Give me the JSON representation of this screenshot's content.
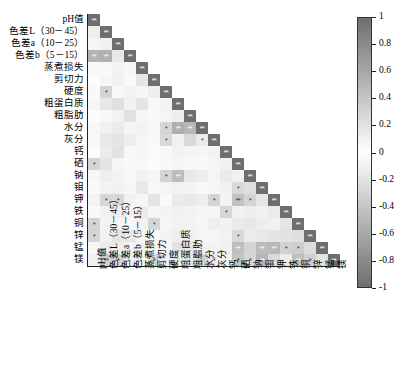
{
  "chart_data": {
    "type": "heatmap",
    "title": "",
    "xlabel": "",
    "ylabel": "",
    "grid": false,
    "triangle": "lower",
    "legend_position": "right",
    "colorbar": {
      "min": -1,
      "max": 1,
      "ticks": [
        "1",
        "0.8",
        "0.6",
        "0.4",
        "0.2",
        "0",
        "-0.2",
        "-0.4",
        "-0.6",
        "-0.8",
        "-1"
      ],
      "tick_values": [
        1,
        0.8,
        0.6,
        0.4,
        0.2,
        0,
        -0.2,
        -0.4,
        -0.6,
        -0.8,
        -1
      ],
      "colormap": "grey-diverging",
      "color_high": "#6e6e6e",
      "color_mid": "#ffffff",
      "color_low": "#6e6e6e"
    },
    "significance_legend": {
      "one_star": "*",
      "two_star": "**"
    },
    "categories": [
      "pH值",
      "色差L（30－45）",
      "色差a（10－25）",
      "色差b（5－15）",
      "蒸煮损失",
      "剪切力",
      "硬度",
      "粗蛋白质",
      "粗脂肪",
      "水分",
      "灰分",
      "钙",
      "硒",
      "钠",
      "钼",
      "钾",
      "铁",
      "铜",
      "锌",
      "锰",
      "镁"
    ],
    "matrix": [
      [
        1.0
      ],
      [
        0.12,
        1.0
      ],
      [
        -0.06,
        0.1,
        1.0
      ],
      [
        0.52,
        0.54,
        0.16,
        1.0
      ],
      [
        0.05,
        -0.04,
        0.08,
        0.06,
        1.0
      ],
      [
        0.02,
        0.06,
        0.1,
        0.04,
        0.18,
        1.0
      ],
      [
        0.04,
        0.3,
        0.05,
        0.08,
        0.06,
        0.12,
        1.0
      ],
      [
        0.06,
        0.16,
        0.22,
        0.1,
        0.18,
        0.05,
        0.08,
        1.0
      ],
      [
        0.03,
        0.05,
        0.09,
        0.2,
        0.06,
        0.04,
        0.07,
        0.12,
        1.0
      ],
      [
        0.05,
        0.1,
        0.14,
        0.06,
        0.08,
        0.05,
        0.28,
        0.55,
        0.5,
        1.0
      ],
      [
        0.04,
        0.16,
        0.18,
        0.12,
        0.07,
        0.04,
        0.27,
        0.1,
        0.26,
        0.14,
        1.0
      ],
      [
        0.02,
        0.14,
        0.2,
        0.05,
        0.06,
        0.03,
        0.05,
        0.09,
        0.07,
        0.06,
        0.08,
        1.0
      ],
      [
        0.29,
        0.18,
        0.06,
        0.04,
        0.05,
        0.03,
        0.04,
        0.06,
        0.05,
        0.04,
        0.06,
        0.1,
        1.0
      ],
      [
        0.06,
        0.12,
        0.08,
        0.05,
        0.1,
        0.06,
        0.3,
        0.46,
        0.16,
        0.12,
        0.07,
        0.14,
        0.1,
        1.0
      ],
      [
        0.04,
        0.08,
        0.1,
        0.06,
        0.16,
        0.05,
        0.07,
        0.09,
        0.08,
        0.05,
        0.06,
        0.1,
        0.26,
        0.22,
        1.0
      ],
      [
        0.08,
        0.28,
        0.27,
        0.1,
        0.06,
        0.18,
        0.05,
        0.14,
        0.16,
        0.12,
        0.29,
        0.08,
        0.42,
        0.3,
        0.18,
        1.0
      ],
      [
        0.05,
        0.1,
        0.12,
        0.07,
        0.14,
        0.06,
        0.08,
        0.1,
        0.09,
        0.06,
        0.07,
        0.28,
        0.1,
        0.12,
        0.1,
        0.14,
        1.0
      ],
      [
        0.3,
        0.08,
        0.06,
        0.05,
        0.1,
        0.28,
        0.07,
        0.09,
        0.08,
        0.06,
        0.12,
        0.1,
        0.14,
        0.16,
        0.12,
        0.1,
        0.18,
        1.0
      ],
      [
        0.29,
        0.1,
        0.18,
        0.16,
        0.06,
        0.05,
        0.08,
        0.12,
        0.1,
        0.07,
        0.06,
        0.09,
        0.27,
        0.14,
        0.16,
        0.18,
        0.2,
        0.22,
        1.0
      ],
      [
        0.06,
        0.14,
        0.12,
        0.08,
        0.1,
        0.06,
        0.07,
        0.2,
        0.18,
        0.09,
        0.08,
        0.1,
        0.44,
        0.3,
        0.46,
        0.48,
        0.32,
        0.34,
        0.24,
        1.0
      ],
      [
        0.1,
        0.33,
        0.31,
        0.12,
        0.08,
        0.29,
        0.1,
        0.14,
        0.16,
        0.31,
        0.12,
        0.09,
        0.4,
        0.28,
        0.52,
        0.26,
        0.14,
        0.45,
        0.33,
        0.2,
        1.0
      ]
    ],
    "significance": [
      {
        "row": 0,
        "col": 0,
        "mark": "**"
      },
      {
        "row": 1,
        "col": 1,
        "mark": "**"
      },
      {
        "row": 2,
        "col": 2,
        "mark": "**"
      },
      {
        "row": 3,
        "col": 0,
        "mark": "**"
      },
      {
        "row": 3,
        "col": 1,
        "mark": "**"
      },
      {
        "row": 3,
        "col": 3,
        "mark": "**"
      },
      {
        "row": 4,
        "col": 4,
        "mark": "**"
      },
      {
        "row": 5,
        "col": 5,
        "mark": "**"
      },
      {
        "row": 6,
        "col": 1,
        "mark": "*"
      },
      {
        "row": 6,
        "col": 6,
        "mark": "**"
      },
      {
        "row": 7,
        "col": 7,
        "mark": "**"
      },
      {
        "row": 8,
        "col": 8,
        "mark": "**"
      },
      {
        "row": 9,
        "col": 6,
        "mark": "*"
      },
      {
        "row": 9,
        "col": 7,
        "mark": "**"
      },
      {
        "row": 9,
        "col": 8,
        "mark": "**"
      },
      {
        "row": 9,
        "col": 9,
        "mark": "**"
      },
      {
        "row": 10,
        "col": 6,
        "mark": "*"
      },
      {
        "row": 10,
        "col": 9,
        "mark": "*"
      },
      {
        "row": 10,
        "col": 10,
        "mark": "**"
      },
      {
        "row": 11,
        "col": 11,
        "mark": "**"
      },
      {
        "row": 12,
        "col": 0,
        "mark": "*"
      },
      {
        "row": 12,
        "col": 12,
        "mark": "**"
      },
      {
        "row": 13,
        "col": 6,
        "mark": "*"
      },
      {
        "row": 13,
        "col": 7,
        "mark": "**"
      },
      {
        "row": 13,
        "col": 13,
        "mark": "**"
      },
      {
        "row": 14,
        "col": 12,
        "mark": "*"
      },
      {
        "row": 14,
        "col": 14,
        "mark": "**"
      },
      {
        "row": 15,
        "col": 1,
        "mark": "*"
      },
      {
        "row": 15,
        "col": 2,
        "mark": "*"
      },
      {
        "row": 15,
        "col": 10,
        "mark": "*"
      },
      {
        "row": 15,
        "col": 12,
        "mark": "**"
      },
      {
        "row": 15,
        "col": 13,
        "mark": "*"
      },
      {
        "row": 15,
        "col": 15,
        "mark": "**"
      },
      {
        "row": 16,
        "col": 11,
        "mark": "*"
      },
      {
        "row": 16,
        "col": 16,
        "mark": "**"
      },
      {
        "row": 17,
        "col": 0,
        "mark": "*"
      },
      {
        "row": 17,
        "col": 5,
        "mark": "*"
      },
      {
        "row": 17,
        "col": 17,
        "mark": "**"
      },
      {
        "row": 18,
        "col": 0,
        "mark": "*"
      },
      {
        "row": 18,
        "col": 12,
        "mark": "*"
      },
      {
        "row": 18,
        "col": 18,
        "mark": "**"
      },
      {
        "row": 19,
        "col": 12,
        "mark": "**"
      },
      {
        "row": 19,
        "col": 14,
        "mark": "**"
      },
      {
        "row": 19,
        "col": 15,
        "mark": "**"
      },
      {
        "row": 19,
        "col": 16,
        "mark": "*"
      },
      {
        "row": 19,
        "col": 17,
        "mark": "*"
      },
      {
        "row": 19,
        "col": 19,
        "mark": "**"
      },
      {
        "row": 20,
        "col": 1,
        "mark": "**"
      },
      {
        "row": 20,
        "col": 2,
        "mark": "*"
      },
      {
        "row": 20,
        "col": 5,
        "mark": "*"
      },
      {
        "row": 20,
        "col": 10,
        "mark": "*"
      },
      {
        "row": 20,
        "col": 12,
        "mark": "*"
      },
      {
        "row": 20,
        "col": 13,
        "mark": "*"
      },
      {
        "row": 20,
        "col": 14,
        "mark": "**"
      },
      {
        "row": 20,
        "col": 17,
        "mark": "**"
      },
      {
        "row": 20,
        "col": 18,
        "mark": "*"
      },
      {
        "row": 20,
        "col": 20,
        "mark": "**"
      }
    ]
  },
  "layout": {
    "grid_left": 88,
    "grid_top": 14,
    "cell": 12.0,
    "n": 21,
    "colorbar_left": 357,
    "colorbar_top": 17,
    "colorbar_width": 15,
    "colorbar_height": 271
  }
}
